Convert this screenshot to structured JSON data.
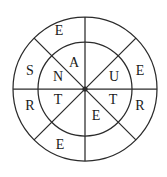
{
  "figure": {
    "type": "word-wheel-puzzle",
    "background_color": "#ffffff",
    "line_color": "#2b2b2b",
    "letter_color": "#1a1a1a"
  },
  "geometry": {
    "center_x": 85,
    "center_y": 89,
    "outer_radius": 72,
    "inner_radius": 47,
    "spoke_count": 8,
    "spoke_angle_step_degrees": 45
  },
  "rings": {
    "outer": {
      "name": "outer-ring",
      "sectors": [
        {
          "id": "outer-n-nw",
          "label": "E",
          "x": 59,
          "y": 32
        },
        {
          "id": "outer-n-ne",
          "label": "",
          "x": 112,
          "y": 32
        },
        {
          "id": "outer-w-nw",
          "label": "S",
          "x": 30,
          "y": 72
        },
        {
          "id": "outer-e-ne",
          "label": "E",
          "x": 140,
          "y": 72
        },
        {
          "id": "outer-w-sw",
          "label": "R",
          "x": 30,
          "y": 107
        },
        {
          "id": "outer-e-se",
          "label": "R",
          "x": 140,
          "y": 107
        },
        {
          "id": "outer-s-sw",
          "label": "E",
          "x": 60,
          "y": 146
        },
        {
          "id": "outer-s-se",
          "label": "",
          "x": 112,
          "y": 146
        }
      ]
    },
    "inner": {
      "name": "inner-ring",
      "sectors": [
        {
          "id": "inner-n-nw",
          "label": "A",
          "x": 74,
          "y": 64
        },
        {
          "id": "inner-n-ne",
          "label": "",
          "x": 98,
          "y": 64
        },
        {
          "id": "inner-w-nw",
          "label": "N",
          "x": 58,
          "y": 78
        },
        {
          "id": "inner-e-ne",
          "label": "U",
          "x": 114,
          "y": 78
        },
        {
          "id": "inner-w-sw",
          "label": "T",
          "x": 58,
          "y": 101
        },
        {
          "id": "inner-e-se",
          "label": "T",
          "x": 113,
          "y": 101
        },
        {
          "id": "inner-s-sw",
          "label": "",
          "x": 72,
          "y": 117
        },
        {
          "id": "inner-s-se",
          "label": "E",
          "x": 96,
          "y": 117
        }
      ]
    }
  },
  "letters_reading": {
    "outer_clockwise_from_top_left": [
      "E",
      "",
      "E",
      "R",
      "",
      "E",
      "R",
      "S"
    ],
    "inner_clockwise_from_top_left": [
      "A",
      "",
      "U",
      "T",
      "E",
      "",
      "T",
      "N"
    ]
  }
}
